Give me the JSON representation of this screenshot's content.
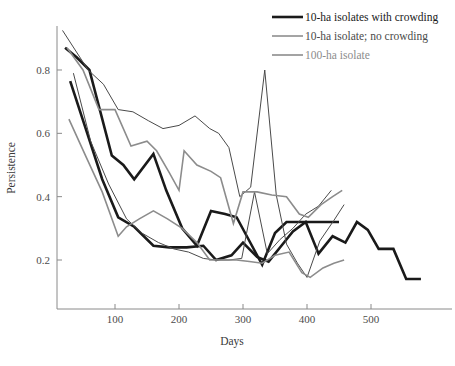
{
  "chart_data": {
    "type": "line",
    "title": "",
    "xlabel": "Days",
    "ylabel": "Persistence",
    "xlim": [
      0,
      600
    ],
    "ylim": [
      0,
      1.0
    ],
    "xticks": [
      100,
      200,
      300,
      400,
      500
    ],
    "yticks": [
      0.2,
      0.4,
      0.6,
      0.8
    ],
    "xtick_labels": [
      "100",
      "200",
      "300",
      "400",
      "500"
    ],
    "ytick_labels": [
      "0.2",
      "0.4",
      "0.6",
      "0.8"
    ],
    "grid": false,
    "legend_position": "top-right",
    "legend": [
      {
        "label": "10-ha isolates with crowding",
        "color": "#1a1a1a",
        "width": 2.6
      },
      {
        "label": "10-ha isolate; no crowding",
        "color": "#4a4a4a",
        "width": 1.0
      },
      {
        "label": "100-ha isolate",
        "color": "#8c8c8c",
        "width": 1.6
      }
    ],
    "series": [
      {
        "name": "10-ha isolates with crowding (A)",
        "group": "10-ha isolates with crowding",
        "color": "#1a1a1a",
        "width": 2.6,
        "x": [
          22,
          40,
          60,
          95,
          113,
          130,
          160,
          180,
          205,
          228,
          250,
          272,
          290,
          310,
          330,
          350,
          368,
          385,
          400,
          420,
          435,
          450
        ],
        "y": [
          0.87,
          0.84,
          0.8,
          0.53,
          0.5,
          0.455,
          0.535,
          0.42,
          0.3,
          0.245,
          0.355,
          0.345,
          0.335,
          0.26,
          0.185,
          0.285,
          0.32,
          0.32,
          0.32,
          0.32,
          0.32,
          0.32
        ]
      },
      {
        "name": "10-ha isolates with crowding (B)",
        "group": "10-ha isolates with crowding",
        "color": "#1a1a1a",
        "width": 2.6,
        "x": [
          30,
          55,
          80,
          105,
          130,
          160,
          185,
          212,
          238,
          258,
          282,
          300,
          322,
          340,
          360,
          378,
          398,
          418,
          440,
          460,
          478,
          495,
          512,
          535,
          555,
          578
        ],
        "y": [
          0.765,
          0.61,
          0.455,
          0.335,
          0.305,
          0.245,
          0.24,
          0.24,
          0.245,
          0.2,
          0.215,
          0.255,
          0.21,
          0.195,
          0.245,
          0.29,
          0.32,
          0.22,
          0.275,
          0.255,
          0.32,
          0.295,
          0.235,
          0.235,
          0.14,
          0.14
        ]
      },
      {
        "name": "10-ha isolate; no crowding (A)",
        "group": "10-ha isolate; no crowding",
        "color": "#4a4a4a",
        "width": 1.0,
        "x": [
          18,
          58,
          82,
          105,
          128,
          152,
          175,
          200,
          225,
          248,
          262,
          278,
          295,
          312,
          334,
          352,
          368,
          385,
          400,
          420,
          442,
          458
        ],
        "y": [
          0.925,
          0.8,
          0.755,
          0.675,
          0.668,
          0.64,
          0.615,
          0.625,
          0.655,
          0.615,
          0.6,
          0.555,
          0.4,
          0.43,
          0.8,
          0.405,
          0.25,
          0.19,
          0.145,
          0.26,
          0.325,
          0.375
        ]
      },
      {
        "name": "10-ha isolate; no crowding (B)",
        "group": "10-ha isolate; no crowding",
        "color": "#4a4a4a",
        "width": 1.0,
        "x": [
          35,
          62,
          90,
          118,
          142,
          168,
          192,
          215,
          238,
          258,
          278,
          298,
          318,
          338,
          358,
          378,
          398,
          418,
          438
        ],
        "y": [
          0.79,
          0.575,
          0.44,
          0.33,
          0.285,
          0.255,
          0.235,
          0.225,
          0.205,
          0.2,
          0.2,
          0.205,
          0.415,
          0.22,
          0.265,
          0.3,
          0.345,
          0.37,
          0.42
        ]
      },
      {
        "name": "100-ha isolate (A)",
        "group": "100-ha isolate",
        "color": "#8c8c8c",
        "width": 1.6,
        "x": [
          25,
          50,
          75,
          100,
          125,
          150,
          165,
          185,
          200,
          208,
          228,
          250,
          265,
          285,
          300,
          322,
          345,
          368,
          388,
          402,
          422,
          440,
          455
        ],
        "y": [
          0.87,
          0.8,
          0.675,
          0.675,
          0.56,
          0.575,
          0.545,
          0.475,
          0.42,
          0.545,
          0.5,
          0.48,
          0.46,
          0.315,
          0.415,
          0.415,
          0.405,
          0.4,
          0.345,
          0.335,
          0.375,
          0.4,
          0.42
        ]
      },
      {
        "name": "100-ha isolate (B)",
        "group": "100-ha isolate",
        "color": "#8c8c8c",
        "width": 1.6,
        "x": [
          28,
          55,
          80,
          105,
          118,
          138,
          160,
          182,
          205,
          228,
          248,
          270,
          290,
          310,
          330,
          350,
          372,
          392,
          405,
          425,
          442,
          458
        ],
        "y": [
          0.645,
          0.525,
          0.415,
          0.275,
          0.305,
          0.33,
          0.355,
          0.33,
          0.3,
          0.255,
          0.2,
          0.2,
          0.2,
          0.195,
          0.19,
          0.215,
          0.225,
          0.16,
          0.145,
          0.175,
          0.19,
          0.2
        ]
      }
    ]
  }
}
